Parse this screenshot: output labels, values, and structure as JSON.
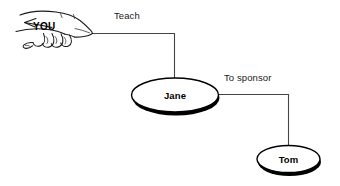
{
  "diagram": {
    "type": "flow-diagram",
    "background_color": "#ffffff",
    "line_color": "#444444",
    "node_fill": "#ffffff",
    "node_stroke": "#000000",
    "text_color": "#000000",
    "actor": {
      "label": "YOU",
      "icon": "pointing-hand-icon"
    },
    "nodes": [
      {
        "id": "jane",
        "label": "Jane",
        "shape": "ellipse"
      },
      {
        "id": "tom",
        "label": "Tom",
        "shape": "ellipse"
      }
    ],
    "edges": [
      {
        "id": "teach",
        "label": "Teach",
        "from": "YOU",
        "to": "Jane"
      },
      {
        "id": "sponsor",
        "label": "To sponsor",
        "from": "Jane",
        "to": "Tom"
      }
    ]
  }
}
